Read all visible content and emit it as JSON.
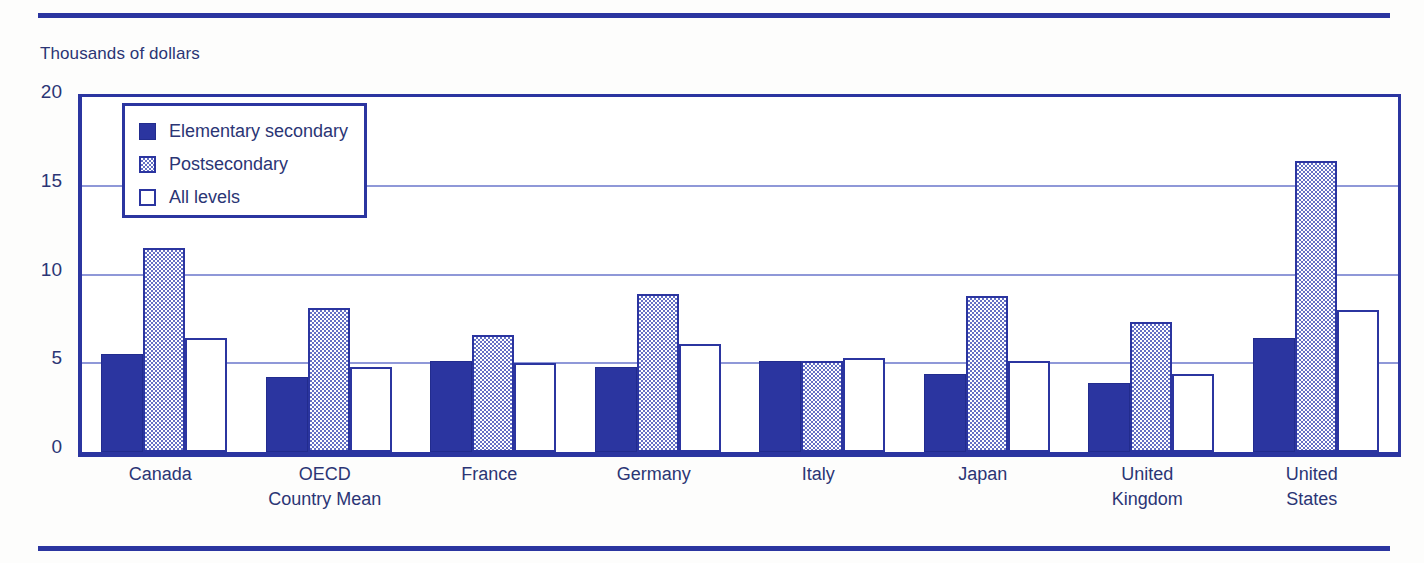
{
  "axis_unit_caption": "Thousands of dollars",
  "legend": {
    "items": [
      {
        "label": "Elementary secondary",
        "swatch": "filled-dark-blue-square-icon",
        "key": "elementary"
      },
      {
        "label": "Postsecondary",
        "swatch": "dithered-light-blue-square-icon",
        "key": "postsecondary"
      },
      {
        "label": "All levels",
        "swatch": "open-white-square-icon",
        "key": "alllevels"
      }
    ]
  },
  "chart_data": {
    "type": "bar",
    "title": "",
    "subtitle": "",
    "xlabel": "",
    "ylabel": "Thousands of dollars",
    "ylim": [
      0,
      20
    ],
    "yticks": [
      0,
      5,
      10,
      15,
      20
    ],
    "ytick_labels": [
      "0",
      "5",
      "10",
      "15",
      "20"
    ],
    "grid": true,
    "grid_axis": "y",
    "legend_position": "upper-left-inside",
    "categories": [
      "Canada",
      "OECD\nCountry Mean",
      "France",
      "Germany",
      "Italy",
      "Japan",
      "United\nKingdom",
      "United\nStates"
    ],
    "series": [
      {
        "name": "Elementary secondary",
        "color": "#2b35a0",
        "values": [
          5.5,
          4.2,
          5.1,
          4.8,
          5.1,
          4.4,
          3.9,
          6.4
        ]
      },
      {
        "name": "Postsecondary",
        "color": "#6470c4",
        "values": [
          11.5,
          8.1,
          6.6,
          8.9,
          5.1,
          8.8,
          7.3,
          16.4
        ]
      },
      {
        "name": "All levels",
        "color": "#ffffff",
        "values": [
          6.4,
          4.8,
          5.0,
          6.1,
          5.3,
          5.1,
          4.4,
          8.0
        ]
      }
    ]
  },
  "colors": {
    "accent": "#2b35a0",
    "gridline": "#8f98d8",
    "text": "#2b3575",
    "background": "#fdfdfc"
  }
}
